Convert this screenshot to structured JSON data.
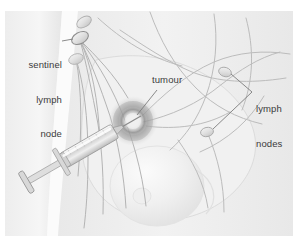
{
  "figure": {
    "style": "greyscale medical illustration"
  },
  "labels": {
    "sentinel": {
      "name": "sentinel-lymph-node-label",
      "line1": "sentinel",
      "line2": "lymph",
      "line3": "node",
      "align": "right",
      "x": 14,
      "y": 36
    },
    "tumour": {
      "name": "tumour-label",
      "text": "tumour",
      "align": "left",
      "x": 152,
      "y": 74
    },
    "lymph_nodes": {
      "name": "lymph-nodes-label",
      "line1": "lymph",
      "line2": "nodes",
      "align": "left",
      "x": 256,
      "y": 80
    }
  },
  "anatomy": {
    "tumour": {
      "label": "tumour",
      "cx": 133,
      "cy": 121,
      "r": 17,
      "tone": "#9a9a9a"
    },
    "sentinel_node": {
      "label": "sentinel lymph node",
      "cx": 80,
      "cy": 38
    },
    "axillary_node_upper": {
      "label": "lymph node",
      "cx": 84,
      "cy": 22
    },
    "axillary_node_lower": {
      "label": "lymph node",
      "cx": 76,
      "cy": 59
    },
    "lymph_node_right_upper": {
      "label": "lymph node",
      "cx": 225,
      "cy": 72
    },
    "lymph_node_right_lower": {
      "label": "lymph node",
      "cx": 207,
      "cy": 132
    },
    "breast_mass": {
      "label": "breast",
      "cx": 157,
      "cy": 186
    },
    "nipple": {
      "label": "nipple",
      "cx": 142,
      "cy": 196
    },
    "syringe": {
      "label": "syringe",
      "tip_x": 129,
      "tip_y": 120,
      "flange_x": 28,
      "flange_y": 180
    }
  },
  "colors": {
    "background": "#ffffff",
    "illustration_bg": "#f4f4f4",
    "skin_light": "#ededed",
    "skin_shade": "#e4e4e4",
    "vessel": "#b3b3b3",
    "vessel_dark": "#9c9c9c",
    "node_fill": "#e0e0e0",
    "node_stroke": "#a8a8a8",
    "tumour": "#8f8f8f",
    "text": "#3b3b3b",
    "leader": "#7d7d7d",
    "syringe_metal": "#c9c9c9",
    "syringe_outline": "#8e8e8e"
  }
}
